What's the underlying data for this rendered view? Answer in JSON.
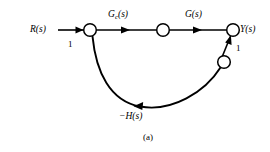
{
  "figure": {
    "caption": "(a)",
    "background_color": "#ffffff",
    "line_color": "#000000"
  },
  "labels": {
    "input": "R(s)",
    "output": "Y(s)",
    "input_gain": "1",
    "feedback_gain": "1",
    "controller_base": "G",
    "controller_subscript": "c",
    "controller_arg": "(s)",
    "plant": "G(s)",
    "feedback": "−H(s)"
  },
  "nodes": [
    {
      "id": "summing-node",
      "label": "",
      "x": 90,
      "y": 30,
      "r": 6.5
    },
    {
      "id": "controller-output-node",
      "label": "",
      "x": 163,
      "y": 30,
      "r": 6.5
    },
    {
      "id": "output-node",
      "label": "Y(s)",
      "x": 233,
      "y": 30,
      "r": 6.5
    },
    {
      "id": "feedback-node",
      "label": "",
      "x": 224,
      "y": 62,
      "r": 6.5
    }
  ],
  "branches": [
    {
      "id": "input-branch",
      "from": "R(s)",
      "to": "summing-node",
      "gain": "1"
    },
    {
      "id": "controller-branch",
      "from": "summing-node",
      "to": "controller-output-node",
      "gain": "G_c(s)"
    },
    {
      "id": "plant-branch",
      "from": "controller-output-node",
      "to": "output-node",
      "gain": "G(s)"
    },
    {
      "id": "feedback-link-branch",
      "from": "feedback-node",
      "to": "output-node",
      "gain": "1"
    },
    {
      "id": "feedback-arc-branch",
      "from": "summing-node",
      "to": "feedback-node",
      "gain": "−H(s)"
    }
  ]
}
